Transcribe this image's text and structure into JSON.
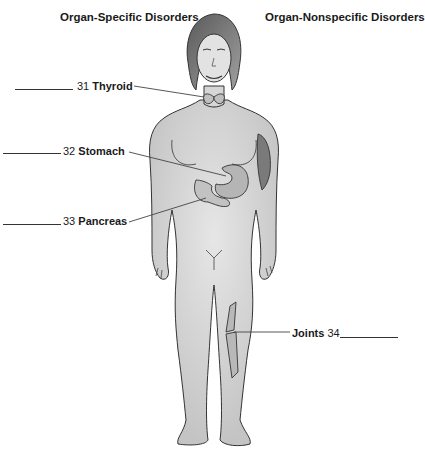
{
  "headings": {
    "left": "Organ-Specific Disorders",
    "right": "Organ-Nonspecific Disorders"
  },
  "labels": [
    {
      "number": "31",
      "name": "Thyroid",
      "side": "left"
    },
    {
      "number": "32",
      "name": "Stomach",
      "side": "left"
    },
    {
      "number": "33",
      "name": "Pancreas",
      "side": "left"
    },
    {
      "number": "34",
      "name": "Joints",
      "side": "right"
    }
  ],
  "figure": {
    "highlighted_structures": [
      "thyroid",
      "stomach",
      "pancreas",
      "muscle-arm",
      "knee-joint-bones"
    ],
    "colors": {
      "skin": "#d8d8d8",
      "outline": "#333333",
      "hair": "#8a8a8a",
      "leader_line": "#444444"
    }
  }
}
